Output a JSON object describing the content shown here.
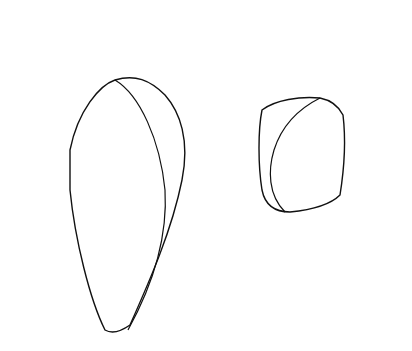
{
  "figure": {
    "colors": {
      "line": "#111111",
      "background": "#ffffff",
      "stipple": "#333333"
    }
  },
  "elements": {
    "bilayer": "phospholipid-bilayer",
    "protein_large": "integral-protein-large",
    "protein_small": "integral-protein-small",
    "heads": "phospholipid-heads",
    "glycolipids": "stippled-glycolipid-heads",
    "tails": "fatty-acid-tails"
  }
}
